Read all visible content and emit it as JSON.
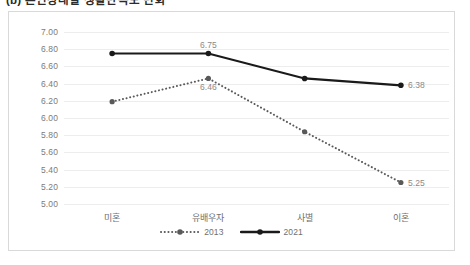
{
  "caption": "(b) 혼인상태별 생활만족도 변화",
  "chart_data": {
    "type": "line",
    "title": "(b) 혼인상태별 생활만족도 변화",
    "xlabel": "",
    "ylabel": "",
    "categories": [
      "미혼",
      "유배우자",
      "사별",
      "이혼"
    ],
    "series": [
      {
        "name": "2013",
        "style": "dotted",
        "color": "#595959",
        "values": [
          6.19,
          6.46,
          5.84,
          5.25
        ],
        "labels": [
          null,
          "6.46",
          null,
          "5.25"
        ],
        "label_positions": [
          null,
          "below",
          null,
          "right"
        ]
      },
      {
        "name": "2021",
        "style": "solid",
        "color": "#1a1a1a",
        "values": [
          6.75,
          6.75,
          6.46,
          6.38
        ],
        "labels": [
          null,
          "6.75",
          null,
          "6.38"
        ],
        "label_positions": [
          null,
          "above",
          null,
          "right"
        ]
      }
    ],
    "ylim": [
      5.0,
      7.0
    ],
    "yticks": [
      "7.00",
      "6.80",
      "6.60",
      "6.40",
      "6.20",
      "6.00",
      "5.80",
      "5.60",
      "5.40",
      "5.20",
      "5.00"
    ],
    "ytick_values": [
      7.0,
      6.8,
      6.6,
      6.4,
      6.2,
      6.0,
      5.8,
      5.6,
      5.4,
      5.2,
      5.0
    ],
    "grid": true,
    "legend_position": "bottom",
    "legend": [
      "2013",
      "2021"
    ]
  }
}
